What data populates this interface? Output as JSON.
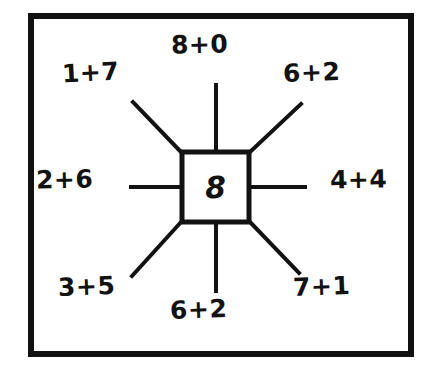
{
  "worksheet": {
    "ink_color": "#121212",
    "background_color": "#ffffff",
    "frame_color": "#111111",
    "center": {
      "value": "8"
    },
    "spokes": [
      {
        "position": "north",
        "label": "8+0"
      },
      {
        "position": "north-west",
        "label": "1+7"
      },
      {
        "position": "north-east",
        "label": "6+2"
      },
      {
        "position": "west",
        "label": "2+6"
      },
      {
        "position": "east",
        "label": "4+4"
      },
      {
        "position": "south-west",
        "label": "3+5"
      },
      {
        "position": "south",
        "label": "6+2"
      },
      {
        "position": "south-east",
        "label": "7+1"
      }
    ]
  }
}
